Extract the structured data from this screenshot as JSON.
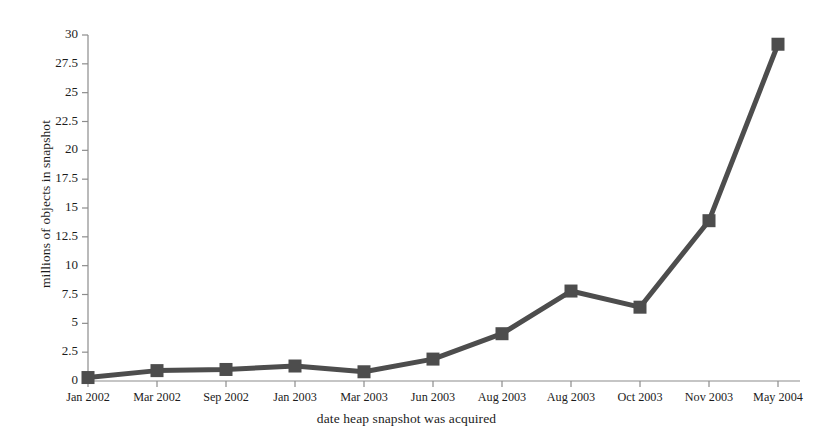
{
  "chart_data": {
    "type": "line",
    "title": "",
    "subtitle": "",
    "xlabel": "date heap snapshot was acquired",
    "ylabel": "millions of objects in snapshot",
    "categories": [
      "Jan 2002",
      "Mar 2002",
      "Sep 2002",
      "Jan 2003",
      "Mar 2003",
      "Jun 2003",
      "Aug 2003",
      "Aug 2003",
      "Oct 2003",
      "Nov 2003",
      "May 2004"
    ],
    "values": [
      0.3,
      0.9,
      1.0,
      1.3,
      0.8,
      1.9,
      4.1,
      7.8,
      6.4,
      13.9,
      29.2
    ],
    "ylim": [
      0,
      30
    ],
    "yticks": [
      0,
      2.5,
      5,
      7.5,
      10,
      12.5,
      15,
      17.5,
      20,
      22.5,
      25,
      27.5,
      30
    ],
    "ytick_labels": [
      "0",
      "2.5",
      "5",
      "7.5",
      "10",
      "12.5",
      "15",
      "17.5",
      "20",
      "22.5",
      "25",
      "27.5",
      "30"
    ],
    "grid": false,
    "legend": null,
    "marker": "square",
    "series_color": "#4d4d4d",
    "axis_color": "#8c8c8c"
  },
  "figure": {
    "background_color": "#ffffff",
    "text_color": "#1c1c1c"
  }
}
